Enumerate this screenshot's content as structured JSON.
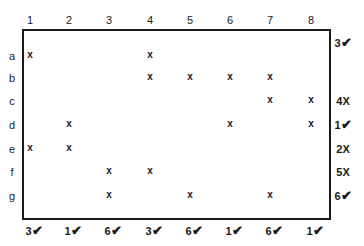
{
  "columns": [
    "1",
    "2",
    "3",
    "4",
    "5",
    "6",
    "7",
    "8"
  ],
  "rows": [
    "a",
    "b",
    "c",
    "d",
    "e",
    "f",
    "g"
  ],
  "grid": {
    "a": [
      1,
      0,
      0,
      1,
      0,
      0,
      0,
      0
    ],
    "b": [
      0,
      0,
      0,
      1,
      1,
      1,
      1,
      0
    ],
    "c": [
      0,
      0,
      0,
      0,
      0,
      0,
      1,
      1
    ],
    "d": [
      0,
      1,
      0,
      0,
      0,
      1,
      0,
      1
    ],
    "e": [
      1,
      1,
      0,
      0,
      0,
      0,
      0,
      0
    ],
    "f": [
      0,
      0,
      1,
      1,
      0,
      0,
      0,
      0
    ],
    "g": [
      0,
      0,
      1,
      0,
      1,
      0,
      1,
      0
    ]
  },
  "mark_symbol": "x",
  "row_tallies": [
    {
      "row": "a",
      "count": "3",
      "status": "check"
    },
    {
      "row": "b",
      "count": "",
      "status": ""
    },
    {
      "row": "c",
      "count": "4",
      "status": "X"
    },
    {
      "row": "d",
      "count": "1",
      "status": "check"
    },
    {
      "row": "e",
      "count": "2",
      "status": "X"
    },
    {
      "row": "f",
      "count": "5",
      "status": "X"
    },
    {
      "row": "g",
      "count": "6",
      "status": "check"
    }
  ],
  "column_tallies": [
    {
      "col": "1",
      "count": "3",
      "status": "check"
    },
    {
      "col": "2",
      "count": "1",
      "status": "check"
    },
    {
      "col": "3",
      "count": "6",
      "status": "check"
    },
    {
      "col": "4",
      "count": "3",
      "status": "check"
    },
    {
      "col": "5",
      "count": "6",
      "status": "check"
    },
    {
      "col": "6",
      "count": "1",
      "status": "check"
    },
    {
      "col": "7",
      "count": "6",
      "status": "check"
    },
    {
      "col": "8",
      "count": "1",
      "status": "check"
    }
  ],
  "symbols": {
    "check": "✔",
    "X": "X"
  }
}
